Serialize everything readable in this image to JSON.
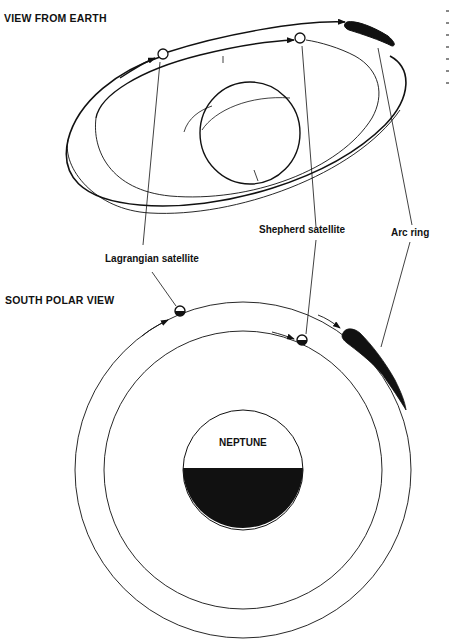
{
  "diagram": {
    "top_view": {
      "heading": "VIEW FROM EARTH"
    },
    "bottom_view": {
      "heading": "SOUTH POLAR VIEW",
      "planet_label": "NEPTUNE"
    },
    "callouts": {
      "lagrangian": "Lagrangian satellite",
      "shepherd": "Shepherd satellite",
      "arc": "Arc ring"
    },
    "colors": {
      "ink": "#111111",
      "background": "#ffffff"
    }
  }
}
